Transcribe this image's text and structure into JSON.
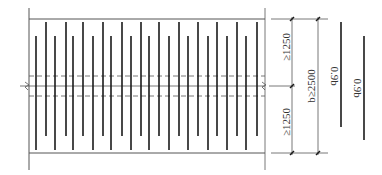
{
  "diagram": {
    "colors": {
      "line": "#1a1a1a",
      "thin": "#555555",
      "text": "#333333",
      "background": "#ffffff"
    },
    "frame": {
      "left_x": 29,
      "right_x": 265,
      "top_y": 19,
      "bottom_y": 153,
      "left_ext_top": 8,
      "left_ext_bottom": 170,
      "right_ext_top": 8,
      "right_ext_bottom": 170
    },
    "center_line_y": 86,
    "dashed_lines_y": [
      76,
      96
    ],
    "long_bars": {
      "y1": 22,
      "y2": 136,
      "x": [
        46,
        66,
        83,
        103,
        122,
        141,
        159,
        179,
        198,
        217,
        237,
        257
      ]
    },
    "short_bars": {
      "y1": 36,
      "y2": 150,
      "x": [
        36,
        55,
        73,
        93,
        111,
        131,
        149,
        169,
        188,
        208,
        227,
        246
      ]
    },
    "dimensions": {
      "inner_line_x": 292,
      "outer_line_x": 318,
      "top_label": "≥1250",
      "bottom_label": "≥1250",
      "total_label": "b≥2500"
    },
    "legend_bars": [
      {
        "x": 341,
        "y1": 22,
        "y2": 127,
        "label": "0.9b"
      },
      {
        "x": 364,
        "y1": 36,
        "y2": 140,
        "label": "0.9b"
      }
    ]
  }
}
